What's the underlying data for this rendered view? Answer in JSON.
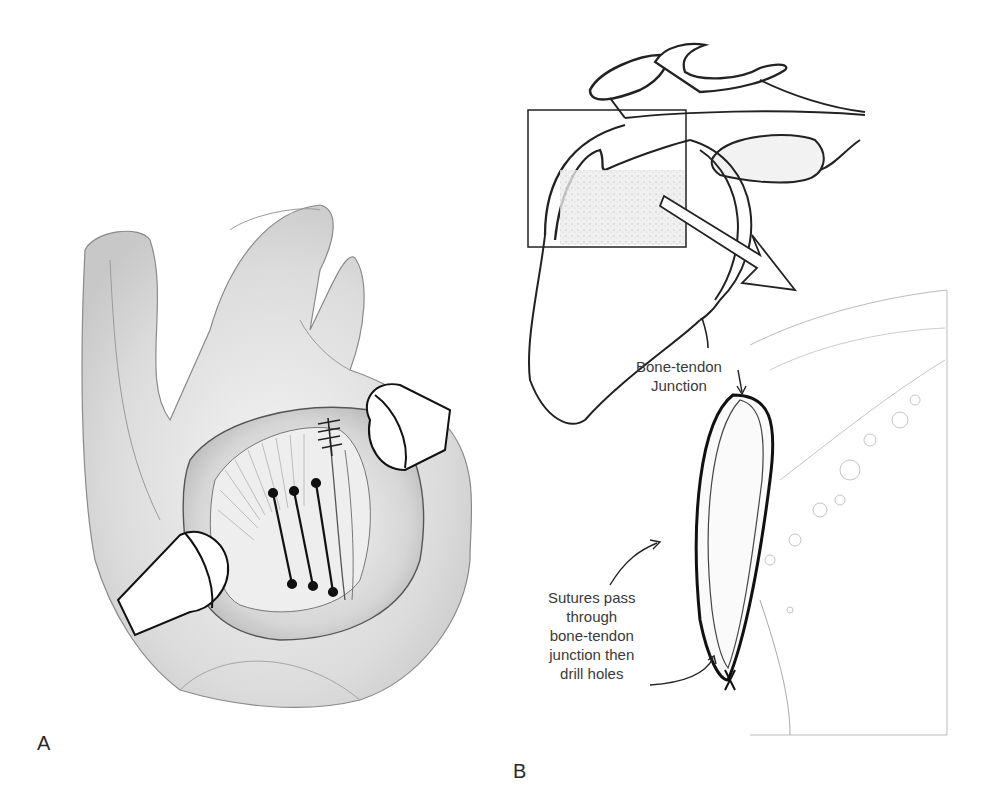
{
  "figure": {
    "panels": [
      {
        "id": "A",
        "letter": "A",
        "description": "Surgical view of open shoulder exposure with retractors and three transosseous sutures"
      },
      {
        "id": "B",
        "letter": "B",
        "description": "Shoulder anatomy with boxed region magnified showing suture loop through bone-tendon junction",
        "annotations": {
          "junction_line1": "Bone-tendon",
          "junction_line2": "Junction",
          "sutures_line1": "Sutures pass",
          "sutures_line2": "through",
          "sutures_line3": "bone-tendon",
          "sutures_line4": "junction then",
          "sutures_line5": "drill holes"
        }
      }
    ]
  }
}
